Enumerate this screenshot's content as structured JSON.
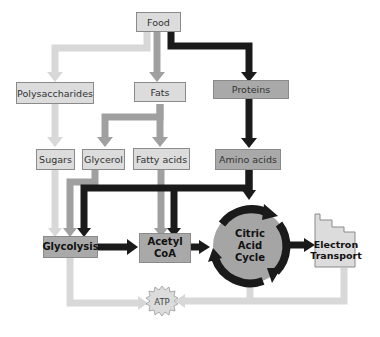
{
  "diagram": {
    "nodes": {
      "food": "Food",
      "polysaccharides": "Polysaccharides",
      "fats": "Fats",
      "proteins": "Proteins",
      "sugars": "Sugars",
      "glycerol": "Glycerol",
      "fatty_acids": "Fatty acids",
      "amino_acids": "Amino acids",
      "glycolysis": "Glycolysis",
      "acetyl_coa_line1": "Acetyl",
      "acetyl_coa_line2": "CoA",
      "citric_line1": "Citric",
      "citric_line2": "Acid",
      "citric_line3": "Cycle",
      "electron_line1": "Electron",
      "electron_line2": "Transport",
      "atp": "ATP"
    },
    "colors": {
      "light_arrow": "#d8d8d8",
      "mid_arrow": "#a0a0a0",
      "dark_arrow": "#1a1a1a",
      "light_box": "#dcdcdc",
      "mid_box": "#a9a9a9",
      "cycle_fill": "#a5a5a5"
    }
  }
}
